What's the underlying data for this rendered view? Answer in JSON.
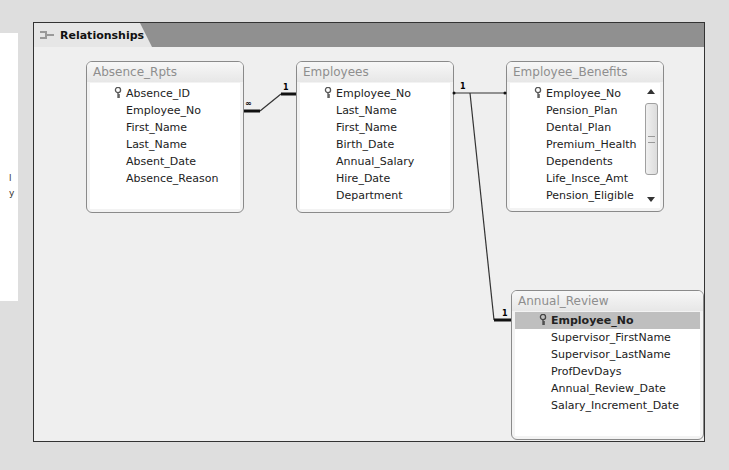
{
  "tab": {
    "label": "Relationships",
    "icon": "relationships-icon"
  },
  "tables": [
    {
      "name": "Absence_Rpts",
      "fields": [
        "Absence_ID",
        "Employee_No",
        "First_Name",
        "Last_Name",
        "Absent_Date",
        "Absence_Reason"
      ],
      "primary_key": "Absence_ID"
    },
    {
      "name": "Employees",
      "fields": [
        "Employee_No",
        "Last_Name",
        "First_Name",
        "Birth_Date",
        "Annual_Salary",
        "Hire_Date",
        "Department"
      ],
      "primary_key": "Employee_No"
    },
    {
      "name": "Employee_Benefits",
      "fields": [
        "Employee_No",
        "Pension_Plan",
        "Dental_Plan",
        "Premium_Health",
        "Dependents",
        "Life_Insce_Amt",
        "Pension_Eligible",
        "Vacation"
      ],
      "primary_key": "Employee_No",
      "has_scrollbar": true
    },
    {
      "name": "Annual_Review",
      "fields": [
        "Employee_No",
        "Supervisor_FirstName",
        "Supervisor_LastName",
        "ProfDevDays",
        "Annual_Review_Date",
        "Salary_Increment_Date"
      ],
      "primary_key": "Employee_No",
      "selected_field": "Employee_No"
    }
  ],
  "relationships": [
    {
      "from": "Employees.Employee_No",
      "to": "Absence_Rpts.Employee_No",
      "from_card": "1",
      "to_card": "∞"
    },
    {
      "from": "Employees.Employee_No",
      "to": "Employee_Benefits.Employee_No",
      "from_card": "1",
      "to_card": ""
    },
    {
      "from": "Employees.Employee_No",
      "to": "Annual_Review.Employee_No",
      "from_card": "",
      "to_card": "1"
    }
  ],
  "side_panel": {
    "marks": [
      "l",
      "y"
    ]
  },
  "colors": {
    "frame_border": "#333333",
    "tab_bar": "#909090",
    "canvas": "#efefef",
    "table_title": "#8e8e8e",
    "selected_row": "#bfbfbf"
  }
}
